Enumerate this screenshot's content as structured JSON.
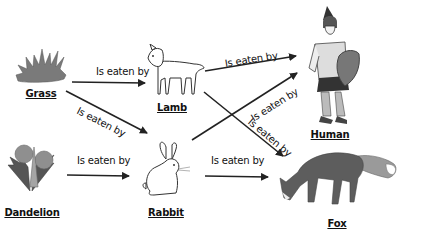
{
  "diagram": {
    "type": "food-web",
    "edge_label": "Is eaten by",
    "nodes": [
      {
        "id": "grass",
        "label": "Grass",
        "icon": "grass-icon"
      },
      {
        "id": "dandelion",
        "label": "Dandelion",
        "icon": "dandelion-icon"
      },
      {
        "id": "lamb",
        "label": "Lamb",
        "icon": "lamb-icon"
      },
      {
        "id": "rabbit",
        "label": "Rabbit",
        "icon": "rabbit-icon"
      },
      {
        "id": "human",
        "label": "Human",
        "icon": "human-icon"
      },
      {
        "id": "fox",
        "label": "Fox",
        "icon": "fox-icon"
      }
    ],
    "edges": [
      {
        "from": "grass",
        "to": "lamb",
        "label": "Is eaten by"
      },
      {
        "from": "grass",
        "to": "rabbit",
        "label": "Is eaten by"
      },
      {
        "from": "dandelion",
        "to": "rabbit",
        "label": "Is eaten by"
      },
      {
        "from": "lamb",
        "to": "human",
        "label": "Is eaten by"
      },
      {
        "from": "lamb",
        "to": "fox",
        "label": "Is eaten by"
      },
      {
        "from": "rabbit",
        "to": "human",
        "label": "Is eaten by"
      },
      {
        "from": "rabbit",
        "to": "fox",
        "label": "Is eaten by"
      }
    ]
  }
}
